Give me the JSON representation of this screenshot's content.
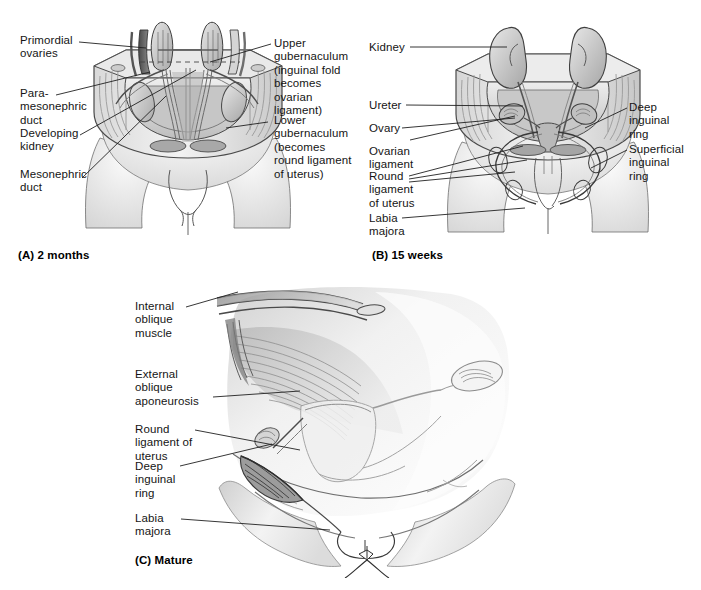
{
  "figure": {
    "background_color": "#ffffff",
    "ink_color": "#151515"
  },
  "panels": [
    {
      "id": "panel-a",
      "caption": "(A) 2 months",
      "labels_left": [
        {
          "name": "primordial-ovaries",
          "text": "Primordial\novaries"
        },
        {
          "name": "paramesonephric-duct",
          "text": "Para-\nmesonephric\nduct"
        },
        {
          "name": "developing-kidney",
          "text": "Developing\nkidney"
        },
        {
          "name": "mesonephric-duct",
          "text": "Mesonephric\nduct"
        }
      ],
      "labels_right": [
        {
          "name": "upper-gubernaculum",
          "text": "Upper\ngubernaculum\n(inguinal fold\nbecomes ovarian\nligament)"
        },
        {
          "name": "lower-gubernaculum",
          "text": "Lower\ngubernaculum\n(becomes\nround ligament\nof uterus)"
        }
      ]
    },
    {
      "id": "panel-b",
      "caption": "(B) 15 weeks",
      "labels_left": [
        {
          "name": "kidney",
          "text": "Kidney"
        },
        {
          "name": "ureter",
          "text": "Ureter"
        },
        {
          "name": "ovary",
          "text": "Ovary"
        },
        {
          "name": "ovarian-ligament",
          "text": "Ovarian\nligament"
        },
        {
          "name": "round-ligament-of-uterus",
          "text": "Round\nligament\nof uterus"
        },
        {
          "name": "labia-majora",
          "text": "Labia\nmajora"
        }
      ],
      "labels_right": [
        {
          "name": "deep-inguinal-ring",
          "text": "Deep\ninguinal\nring"
        },
        {
          "name": "superficial-inguinal-ring",
          "text": "Superficial\ninguinal\nring"
        }
      ]
    },
    {
      "id": "panel-c",
      "caption": "(C) Mature",
      "labels_left": [
        {
          "name": "internal-oblique-muscle",
          "text": "Internal\noblique\nmuscle"
        },
        {
          "name": "external-oblique-aponeurosis",
          "text": "External\noblique\naponeurosis"
        },
        {
          "name": "round-ligament-of-uterus",
          "text": "Round\nligament of\nuterus"
        },
        {
          "name": "deep-inguinal-ring",
          "text": "Deep\ninguinal\nring"
        },
        {
          "name": "labia-majora",
          "text": "Labia\nmajora"
        }
      ],
      "labels_right": []
    }
  ]
}
